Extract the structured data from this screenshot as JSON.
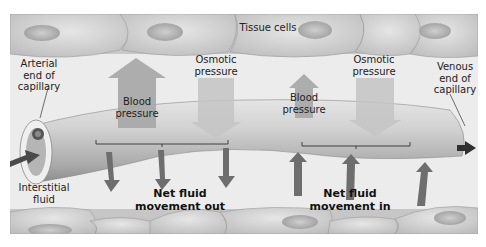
{
  "diagram": {
    "labels": {
      "tissue_cells": "Tissue cells",
      "arterial_end": "Arterial\nend of\ncapillary",
      "venous_end": "Venous\nend of\ncapillary",
      "interstitial_fluid": "Interstitial\nfluid",
      "osmotic_left": "Osmotic\npressure",
      "osmotic_right": "Osmotic\npressure",
      "blood_left": "Blood\npressure",
      "blood_right": "Blood\npressure",
      "net_out": "Net fluid\nmovement out",
      "net_in": "Net fluid\nmovement in"
    },
    "forces": {
      "arterial": {
        "blood_pressure": "large (outward)",
        "osmotic_pressure": "medium (inward)"
      },
      "venous": {
        "blood_pressure": "small (outward)",
        "osmotic_pressure": "medium (inward)"
      }
    },
    "colors": {
      "background": "#ececec",
      "cells": "#d6d6d6",
      "capillary": "#c9c9c9",
      "pressure_arrow": "#a8a8a8",
      "fluid_arrow": "#6e6e6e",
      "flow_arrow": "#3a3a3a"
    }
  }
}
